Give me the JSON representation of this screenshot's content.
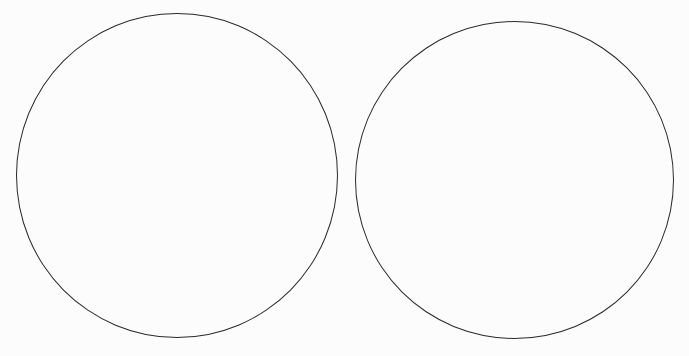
{
  "diagram": {
    "type": "two-circle comparison (blank)",
    "background_color": "#fcfcfc",
    "stroke_color": "#2a2a2a",
    "shapes": [
      {
        "id": "left-circle",
        "label": "",
        "bbox": [
          16,
          13,
          322,
          325
        ]
      },
      {
        "id": "right-circle",
        "label": "",
        "bbox": [
          355,
          21,
          319,
          318
        ]
      }
    ]
  }
}
